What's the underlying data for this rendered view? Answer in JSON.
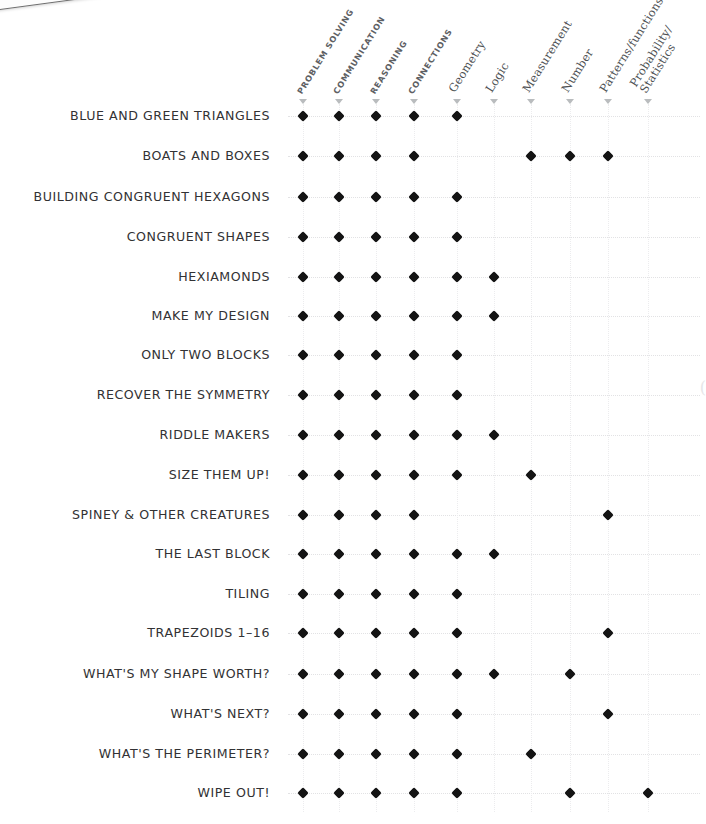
{
  "scrap": {
    "text": "to Re"
  },
  "columns": [
    {
      "id": "problem-solving",
      "label": "PROBLEM SOLVING",
      "lines": [
        "PROBLEM SOLVING"
      ],
      "style": "caps",
      "x": 303
    },
    {
      "id": "communication",
      "label": "COMMUNICATION",
      "lines": [
        "COMMUNICATION"
      ],
      "style": "caps",
      "x": 339
    },
    {
      "id": "reasoning",
      "label": "REASONING",
      "lines": [
        "REASONING"
      ],
      "style": "caps",
      "x": 376
    },
    {
      "id": "connections",
      "label": "CONNECTIONS",
      "lines": [
        "CONNECTIONS"
      ],
      "style": "caps",
      "x": 414
    },
    {
      "id": "geometry",
      "label": "Geometry",
      "lines": [
        "Geometry"
      ],
      "style": "mixed",
      "x": 457
    },
    {
      "id": "logic",
      "label": "Logic",
      "lines": [
        "Logic"
      ],
      "style": "mixed",
      "x": 494
    },
    {
      "id": "measurement",
      "label": "Measurement",
      "lines": [
        "Measurement"
      ],
      "style": "mixed",
      "x": 531
    },
    {
      "id": "number",
      "label": "Number",
      "lines": [
        "Number"
      ],
      "style": "mixed",
      "x": 570
    },
    {
      "id": "patterns-functions",
      "label": "Patterns/functions",
      "lines": [
        "Patterns/functions"
      ],
      "style": "mixed",
      "x": 608
    },
    {
      "id": "probability-statistics",
      "label": "Probability/ Statistics",
      "lines": [
        "Probability/",
        "Statistics"
      ],
      "style": "mixed",
      "x": 648
    }
  ],
  "rows": [
    {
      "id": "blue-and-green-triangles",
      "label": "BLUE AND GREEN TRIANGLES",
      "y": 116,
      "marks": [
        1,
        1,
        1,
        1,
        1,
        0,
        0,
        0,
        0,
        0
      ]
    },
    {
      "id": "boats-and-boxes",
      "label": "BOATS AND BOXES",
      "y": 156,
      "marks": [
        1,
        1,
        1,
        1,
        0,
        0,
        1,
        1,
        1,
        0
      ]
    },
    {
      "id": "building-congruent-hexagons",
      "label": "BUILDING CONGRUENT HEXAGONS",
      "y": 197,
      "marks": [
        1,
        1,
        1,
        1,
        1,
        0,
        0,
        0,
        0,
        0
      ]
    },
    {
      "id": "congruent-shapes",
      "label": "CONGRUENT SHAPES",
      "y": 237,
      "marks": [
        1,
        1,
        1,
        1,
        1,
        0,
        0,
        0,
        0,
        0
      ]
    },
    {
      "id": "hexiamonds",
      "label": "HEXIAMONDS",
      "y": 277,
      "marks": [
        1,
        1,
        1,
        1,
        1,
        1,
        0,
        0,
        0,
        0
      ]
    },
    {
      "id": "make-my-design",
      "label": "MAKE MY DESIGN",
      "y": 316,
      "marks": [
        1,
        1,
        1,
        1,
        1,
        1,
        0,
        0,
        0,
        0
      ]
    },
    {
      "id": "only-two-blocks",
      "label": "ONLY TWO BLOCKS",
      "y": 355,
      "marks": [
        1,
        1,
        1,
        1,
        1,
        0,
        0,
        0,
        0,
        0
      ]
    },
    {
      "id": "recover-the-symmetry",
      "label": "RECOVER THE SYMMETRY",
      "y": 395,
      "marks": [
        1,
        1,
        1,
        1,
        1,
        0,
        0,
        0,
        0,
        0
      ]
    },
    {
      "id": "riddle-makers",
      "label": "RIDDLE MAKERS",
      "y": 435,
      "marks": [
        1,
        1,
        1,
        1,
        1,
        1,
        0,
        0,
        0,
        0
      ]
    },
    {
      "id": "size-them-up",
      "label": "SIZE THEM UP!",
      "y": 475,
      "marks": [
        1,
        1,
        1,
        1,
        1,
        0,
        1,
        0,
        0,
        0
      ]
    },
    {
      "id": "spiney-and-other-creatures",
      "label": "SPINEY & OTHER CREATURES",
      "y": 515,
      "marks": [
        1,
        1,
        1,
        1,
        0,
        0,
        0,
        0,
        1,
        0
      ]
    },
    {
      "id": "the-last-block",
      "label": "THE LAST BLOCK",
      "y": 554,
      "marks": [
        1,
        1,
        1,
        1,
        1,
        1,
        0,
        0,
        0,
        0
      ]
    },
    {
      "id": "tiling",
      "label": "TILING",
      "y": 594,
      "marks": [
        1,
        1,
        1,
        1,
        1,
        0,
        0,
        0,
        0,
        0
      ]
    },
    {
      "id": "trapezoids-1-16",
      "label": "TRAPEZOIDS 1–16",
      "y": 633,
      "marks": [
        1,
        1,
        1,
        1,
        1,
        0,
        0,
        0,
        1,
        0
      ]
    },
    {
      "id": "whats-my-shape-worth",
      "label": "WHAT'S MY SHAPE WORTH?",
      "y": 674,
      "marks": [
        1,
        1,
        1,
        1,
        1,
        1,
        0,
        1,
        0,
        0
      ]
    },
    {
      "id": "whats-next",
      "label": "WHAT'S NEXT?",
      "y": 714,
      "marks": [
        1,
        1,
        1,
        1,
        1,
        0,
        0,
        0,
        1,
        0
      ]
    },
    {
      "id": "whats-the-perimeter",
      "label": "WHAT'S THE PERIMETER?",
      "y": 754,
      "marks": [
        1,
        1,
        1,
        1,
        1,
        0,
        1,
        0,
        0,
        0
      ]
    },
    {
      "id": "wipe-out",
      "label": "WIPE OUT!",
      "y": 793,
      "marks": [
        1,
        1,
        1,
        1,
        1,
        0,
        0,
        1,
        0,
        1
      ]
    }
  ],
  "layout": {
    "label_right_edge": 270,
    "header_baseline_y": 95,
    "caret_y": 99,
    "grid_left": 288,
    "grid_right": 700,
    "grid_top": 104,
    "grid_bottom": 812
  },
  "colors": {
    "marker": "#141414",
    "gridline": "#e2e2e4",
    "row_label": "#323234",
    "col_header": "#55585a",
    "caret": "#b9bcbe",
    "background": "#ffffff"
  }
}
